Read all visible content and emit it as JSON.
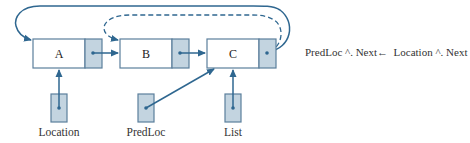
{
  "diagram": {
    "type": "linked-list-deletion",
    "nodes": [
      {
        "id": "A",
        "label": "A"
      },
      {
        "id": "B",
        "label": "B"
      },
      {
        "id": "C",
        "label": "C"
      }
    ],
    "pointers": [
      {
        "id": "location",
        "label": "Location",
        "points_to": "A"
      },
      {
        "id": "predloc",
        "label": "PredLoc",
        "points_to": "C"
      },
      {
        "id": "list",
        "label": "List",
        "points_to": "C"
      }
    ],
    "links": [
      {
        "from": "A",
        "to": "B",
        "style": "solid"
      },
      {
        "from": "B",
        "to": "C",
        "style": "solid"
      },
      {
        "from": "C",
        "to": "A",
        "style": "solid",
        "note": "new link (curved over top)"
      },
      {
        "from": "C",
        "to": "B",
        "style": "dashed",
        "note": "old link (removed)"
      }
    ],
    "statement": "PredLoc ^. Next←  Location ^. Next"
  },
  "colors": {
    "stroke": "#5b7f9c",
    "pointer_fill": "#c3d4e0",
    "arrow": "#2f6790"
  }
}
